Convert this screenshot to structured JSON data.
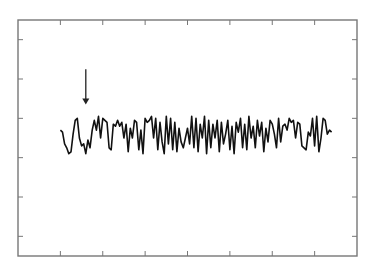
{
  "chart_data": {
    "type": "line",
    "title": "",
    "xlabel": "",
    "ylabel": "",
    "xlim": [
      0,
      8
    ],
    "ylim": [
      0,
      6
    ],
    "xticks": [
      1,
      2,
      3,
      4,
      5,
      6,
      7
    ],
    "yticks": [
      0.5,
      1.5,
      2.5,
      3.5,
      4.5,
      5.5
    ],
    "xtick_labels": [],
    "ytick_labels": [],
    "grid": false,
    "legend": "none",
    "colors": {
      "line": "#111111",
      "axis": "#777777",
      "arrow": "#222222"
    },
    "annotations": [
      {
        "type": "arrow",
        "label": "",
        "x": 1.6,
        "y_from": 4.75,
        "y_to": 3.85
      }
    ],
    "series": [
      {
        "name": "signal",
        "x": [
          1.0,
          1.05,
          1.1,
          1.15,
          1.2,
          1.25,
          1.3,
          1.35,
          1.4,
          1.45,
          1.5,
          1.55,
          1.6,
          1.65,
          1.7,
          1.75,
          1.8,
          1.85,
          1.9,
          1.95,
          2.0,
          2.05,
          2.1,
          2.15,
          2.2,
          2.25,
          2.3,
          2.35,
          2.4,
          2.45,
          2.5,
          2.55,
          2.6,
          2.65,
          2.7,
          2.75,
          2.8,
          2.85,
          2.9,
          2.95,
          3.0,
          3.05,
          3.1,
          3.15,
          3.2,
          3.25,
          3.3,
          3.35,
          3.4,
          3.45,
          3.5,
          3.55,
          3.6,
          3.65,
          3.7,
          3.75,
          3.8,
          3.85,
          3.9,
          3.95,
          4.0,
          4.05,
          4.1,
          4.15,
          4.2,
          4.25,
          4.3,
          4.35,
          4.4,
          4.45,
          4.5,
          4.55,
          4.6,
          4.65,
          4.7,
          4.75,
          4.8,
          4.85,
          4.9,
          4.95,
          5.0,
          5.05,
          5.1,
          5.15,
          5.2,
          5.25,
          5.3,
          5.35,
          5.4,
          5.45,
          5.5,
          5.55,
          5.6,
          5.65,
          5.7,
          5.75,
          5.8,
          5.85,
          5.9,
          5.95,
          6.0,
          6.05,
          6.1,
          6.15,
          6.2,
          6.25,
          6.3,
          6.35,
          6.4,
          6.45,
          6.5,
          6.55,
          6.6,
          6.65,
          6.7,
          6.75,
          6.8,
          6.85,
          6.9,
          6.95,
          7.0,
          7.05,
          7.1,
          7.15,
          7.2,
          7.25,
          7.3,
          7.35,
          7.4
        ],
        "y": [
          3.2,
          3.15,
          2.85,
          2.75,
          2.6,
          2.65,
          3.1,
          3.45,
          3.5,
          3.0,
          2.8,
          2.85,
          2.6,
          2.95,
          2.75,
          3.2,
          3.45,
          3.2,
          3.55,
          3.0,
          3.5,
          3.45,
          3.4,
          2.75,
          2.7,
          3.35,
          3.3,
          3.45,
          3.3,
          3.4,
          3.0,
          3.35,
          2.65,
          3.25,
          3.0,
          3.45,
          3.4,
          2.7,
          3.2,
          2.6,
          3.5,
          3.4,
          3.45,
          3.55,
          3.0,
          3.5,
          2.7,
          3.4,
          2.9,
          2.6,
          3.55,
          2.85,
          3.5,
          2.7,
          3.4,
          2.65,
          3.25,
          2.9,
          2.75,
          3.0,
          3.25,
          2.85,
          3.55,
          2.75,
          3.5,
          2.65,
          3.35,
          3.0,
          3.55,
          2.6,
          3.45,
          2.75,
          3.35,
          3.0,
          3.45,
          2.65,
          3.4,
          2.85,
          3.1,
          3.45,
          2.7,
          3.3,
          2.6,
          3.4,
          3.15,
          3.5,
          2.75,
          3.35,
          2.7,
          3.55,
          3.0,
          3.3,
          2.75,
          3.45,
          3.05,
          3.4,
          2.65,
          3.25,
          2.9,
          3.45,
          3.35,
          3.1,
          2.75,
          3.5,
          2.9,
          3.3,
          3.35,
          3.2,
          3.5,
          3.4,
          3.45,
          3.0,
          3.4,
          3.35,
          2.8,
          2.75,
          2.7,
          3.15,
          3.05,
          3.5,
          2.8,
          3.55,
          2.65,
          3.0,
          3.5,
          3.45,
          3.1,
          3.2,
          3.15
        ]
      }
    ]
  }
}
